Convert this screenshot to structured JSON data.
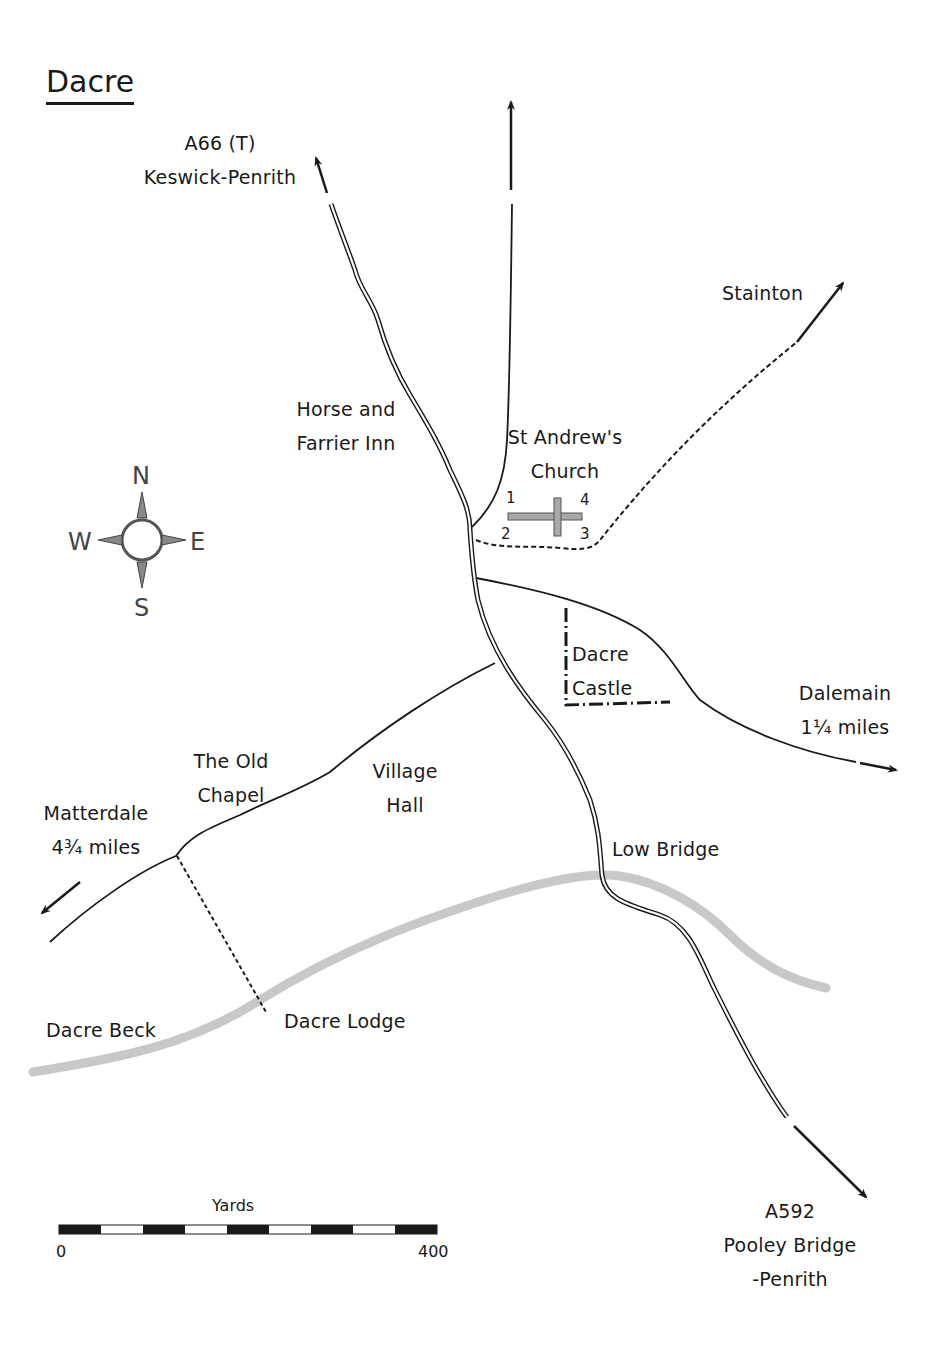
{
  "title": "Dacre",
  "roads": {
    "a66": {
      "line1": "A66 (T)",
      "line2": "Keswick-Penrith"
    },
    "a592": {
      "line1": "A592",
      "line2": "Pooley Bridge",
      "line3": "-Penrith"
    },
    "stainton": {
      "label": "Stainton"
    },
    "dalemain": {
      "line1": "Dalemain",
      "line2": "1¼ miles"
    },
    "matterdale": {
      "line1": "Matterdale",
      "line2": "4¾ miles"
    }
  },
  "places": {
    "inn": {
      "line1": "Horse and",
      "line2": "Farrier Inn"
    },
    "church": {
      "line1": "St Andrew's",
      "line2": "Church",
      "markers": [
        "1",
        "2",
        "3",
        "4"
      ]
    },
    "castle": {
      "line1": "Dacre",
      "line2": "Castle"
    },
    "chapel": {
      "line1": "The Old",
      "line2": "Chapel"
    },
    "hall": {
      "line1": "Village",
      "line2": "Hall"
    },
    "low_bridge": {
      "label": "Low Bridge"
    },
    "lodge": {
      "label": "Dacre Lodge"
    },
    "beck": {
      "label": "Dacre Beck"
    }
  },
  "compass": {
    "n": "N",
    "e": "E",
    "s": "S",
    "w": "W"
  },
  "scale": {
    "unit": "Yards",
    "min": "0",
    "max": "400",
    "segments": 9
  },
  "colors": {
    "ink": "#1a1a1a",
    "river": "#c8c8c8",
    "church": "#a9a9a9"
  }
}
